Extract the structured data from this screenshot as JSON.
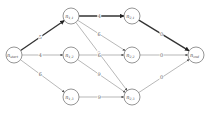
{
  "diagram": {
    "type": "layered-graph",
    "nodes": [
      {
        "id": "start",
        "label": "n_start",
        "main": "n",
        "sub": "start",
        "x": 14,
        "y": 55
      },
      {
        "id": "n11",
        "label": "n_1,1",
        "main": "n",
        "sub": "1,1",
        "x": 71,
        "y": 16
      },
      {
        "id": "n12",
        "label": "n_1,2",
        "main": "n",
        "sub": "1,2",
        "x": 71,
        "y": 55
      },
      {
        "id": "n13",
        "label": "n_1,3",
        "main": "n",
        "sub": "1,3",
        "x": 71,
        "y": 97
      },
      {
        "id": "n21",
        "label": "n_2,1",
        "main": "n",
        "sub": "2,1",
        "x": 132,
        "y": 16
      },
      {
        "id": "n22",
        "label": "n_2,2",
        "main": "n",
        "sub": "2,2",
        "x": 132,
        "y": 55
      },
      {
        "id": "n23",
        "label": "n_2,3",
        "main": "n",
        "sub": "2,3",
        "x": 132,
        "y": 97
      },
      {
        "id": "end",
        "label": "n_end",
        "main": "n",
        "sub": "end",
        "x": 196,
        "y": 55
      }
    ],
    "edges": [
      {
        "from": "start",
        "to": "n11",
        "weight": "5",
        "bold": true
      },
      {
        "from": "start",
        "to": "n12",
        "weight": "4",
        "bold": false
      },
      {
        "from": "start",
        "to": "n13",
        "weight": "6",
        "bold": false
      },
      {
        "from": "n11",
        "to": "n21",
        "weight": "4",
        "bold": true
      },
      {
        "from": "n11",
        "to": "n22",
        "weight": "6",
        "bold": false
      },
      {
        "from": "n11",
        "to": "n23",
        "weight": "9",
        "bold": false
      },
      {
        "from": "n12",
        "to": "n22",
        "weight": "6",
        "bold": false
      },
      {
        "from": "n12",
        "to": "n23",
        "weight": "9",
        "bold": false
      },
      {
        "from": "n13",
        "to": "n23",
        "weight": "9",
        "bold": false
      },
      {
        "from": "n21",
        "to": "end",
        "weight": "0",
        "bold": true
      },
      {
        "from": "n22",
        "to": "end",
        "weight": "0",
        "bold": false
      },
      {
        "from": "n23",
        "to": "end",
        "weight": "0",
        "bold": false
      }
    ],
    "highlighted_path": [
      "start",
      "n11",
      "n21",
      "end"
    ],
    "colors": {
      "edge": "#9a9a9a",
      "bold_edge": "#333333",
      "node_stroke": "#7a7a7a"
    }
  }
}
